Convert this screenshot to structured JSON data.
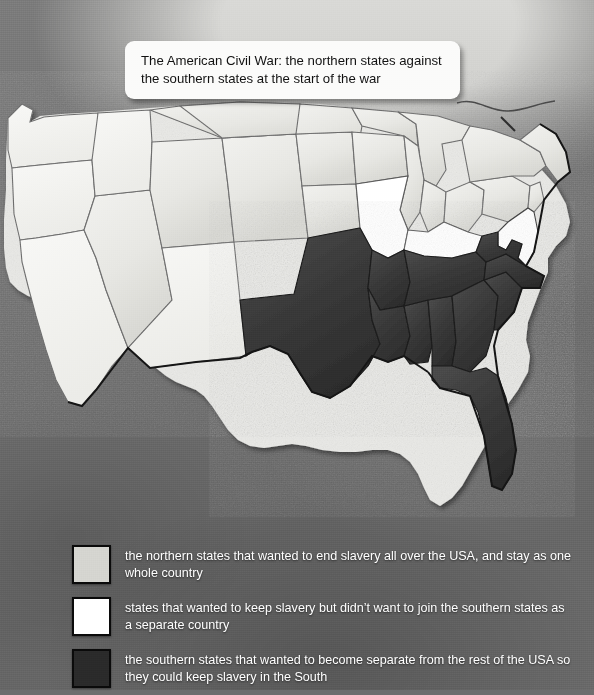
{
  "map": {
    "title": "The American Civil War: the northern states against the southern states at the start of the war",
    "subject": "United States Civil War 1861 alignment map",
    "colors": {
      "union": "#e9e9e6",
      "border_state": "#ffffff",
      "confederate": "#3b3b3b",
      "sea": "#6e6e6e",
      "outline": "#1a1a1a",
      "legend_text": "#ffffff",
      "callout_background": "#fbfbfa",
      "callout_text": "#111111"
    }
  },
  "legend": {
    "items": [
      {
        "swatch": "union",
        "color": "#d5d5d0",
        "label": "the northern states that wanted to end slavery all over the USA, and stay as one whole country"
      },
      {
        "swatch": "border-state",
        "color": "#ffffff",
        "label": "states that wanted to keep slavery but didn’t want to join the southern states as a separate country"
      },
      {
        "swatch": "confederate",
        "color": "#2a2a2a",
        "label": "the southern states that wanted to become separate from the rest of the USA so they could keep slavery in the South"
      }
    ]
  },
  "regions": {
    "union": [
      "Washington Territory",
      "Oregon",
      "California",
      "Nevada",
      "Idaho Territory",
      "Utah Territory",
      "Colorado Territory",
      "Nebraska Territory",
      "Kansas",
      "Minnesota",
      "Iowa",
      "Wisconsin",
      "Illinois",
      "Michigan",
      "Indiana",
      "Ohio",
      "Pennsylvania",
      "New York",
      "New Jersey",
      "Connecticut",
      "Rhode Island",
      "Massachusetts",
      "Vermont",
      "New Hampshire",
      "Maine"
    ],
    "border_states": [
      "Missouri",
      "Kentucky",
      "Maryland",
      "Delaware"
    ],
    "confederate": [
      "Texas",
      "Arkansas",
      "Louisiana",
      "Mississippi",
      "Alabama",
      "Tennessee",
      "Georgia",
      "Florida",
      "South Carolina",
      "North Carolina",
      "Virginia"
    ]
  }
}
